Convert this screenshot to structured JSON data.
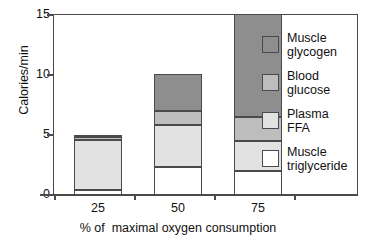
{
  "chart_data": {
    "type": "bar",
    "stacked": true,
    "title": "",
    "xlabel": "% of  maximal oxygen consumption",
    "ylabel": "Calories/min",
    "categories": [
      "25",
      "50",
      "75"
    ],
    "ylim": [
      0,
      15
    ],
    "y_ticks": [
      "0",
      "5",
      "10",
      "15"
    ],
    "grid": false,
    "legend_position": "right",
    "series": [
      {
        "name": "Muscle triglyceride",
        "label_lines": [
          "Muscle",
          "triglyceride"
        ],
        "color": "#ffffff",
        "values": [
          0.4,
          2.3,
          2.0
        ]
      },
      {
        "name": "Plasma FFA",
        "label_lines": [
          "Plasma",
          "FFA"
        ],
        "color": "#e2e2e2",
        "values": [
          4.2,
          3.5,
          2.5
        ]
      },
      {
        "name": "Blood glucose",
        "label_lines": [
          "Blood",
          "glucose"
        ],
        "color": "#bdbdbd",
        "values": [
          0.2,
          1.2,
          2.0
        ]
      },
      {
        "name": "Muscle glycogen",
        "label_lines": [
          "Muscle",
          "glycogen"
        ],
        "color": "#8e8e8e",
        "values": [
          0.2,
          3.0,
          8.5
        ]
      }
    ],
    "totals": [
      5.0,
      10.0,
      15.0
    ]
  },
  "legend": {
    "entries": [
      {
        "line1": "Muscle",
        "line2": "glycogen",
        "swatch": "glycogen"
      },
      {
        "line1": "Blood",
        "line2": "glucose",
        "swatch": "glucose"
      },
      {
        "line1": "Plasma",
        "line2": "FFA",
        "swatch": "ffa"
      },
      {
        "line1": "Muscle",
        "line2": "triglyceride",
        "swatch": "trig"
      }
    ]
  },
  "axes": {
    "y_title": "Calories/min",
    "x_title": "% of  maximal oxygen consumption",
    "y_tick_labels": [
      "15",
      "10",
      "5",
      "0"
    ],
    "x_tick_labels": [
      "25",
      "50",
      "75"
    ]
  },
  "colors": {
    "axis": "#4a4a4a",
    "glycogen": "#8e8e8e",
    "glucose": "#bdbdbd",
    "ffa": "#e2e2e2",
    "trig": "#ffffff"
  }
}
